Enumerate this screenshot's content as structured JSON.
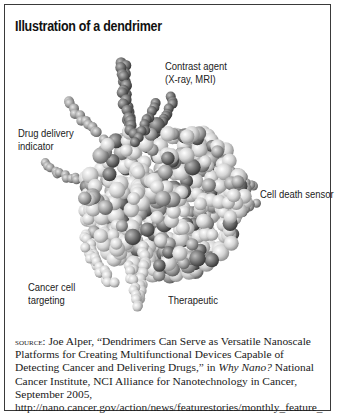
{
  "figure": {
    "title": "Illustration of a dendrimer",
    "labels": {
      "contrast_agent_line1": "Contrast agent",
      "contrast_agent_line2": "(X-ray, MRI)",
      "drug_delivery_line1": "Drug delivery",
      "drug_delivery_line2": "indicator",
      "cell_death_sensor": "Cell death sensor",
      "cancer_cell_line1": "Cancer cell",
      "cancer_cell_line2": "targeting",
      "therapeutic": "Therapeutic"
    },
    "colors": {
      "border": "#3a3a3a",
      "sphere_light": "#d8d8d8",
      "sphere_mid": "#a8a8a8",
      "sphere_dark": "#6e6e6e"
    }
  },
  "source": {
    "prefix": "source:",
    "text_1": " Joe Alper, “Dendrimers Can Serve as Versatile Nanoscale Platforms for Creating Multifunctional Devices Capable of Detecting Cancer and Delivering Drugs,” in ",
    "publication": "Why Nano?",
    "text_2": " National Cancer Institute, NCI Alliance for Nanotechnology in Cancer, September 2005, http://nano.cancer.gov/action/news/featurestories/monthly_feature_ 2005_sep.asp (accessed January 17, 2012)"
  }
}
